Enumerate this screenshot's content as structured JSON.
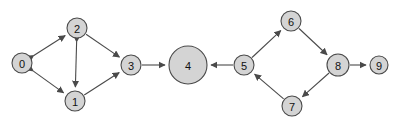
{
  "figure": {
    "title": "",
    "background_color": "#ffffff",
    "width": 399,
    "height": 121
  },
  "chart_data": {
    "type": "diagram",
    "diagram_kind": "directed-graph",
    "title": "",
    "node_fill_color": "#d4d4d4",
    "node_stroke_color": "#4a4a4a",
    "edge_color": "#4a4a4a",
    "label_color": "#111111",
    "nodes": [
      {
        "id": "0",
        "label": "0",
        "x": 22,
        "y": 63,
        "r": 10
      },
      {
        "id": "1",
        "label": "1",
        "x": 75,
        "y": 101,
        "r": 10
      },
      {
        "id": "2",
        "label": "2",
        "x": 77,
        "y": 28,
        "r": 10
      },
      {
        "id": "3",
        "label": "3",
        "x": 131,
        "y": 65,
        "r": 10
      },
      {
        "id": "4",
        "label": "4",
        "x": 188,
        "y": 65,
        "r": 19
      },
      {
        "id": "5",
        "label": "5",
        "x": 244,
        "y": 65,
        "r": 10
      },
      {
        "id": "6",
        "label": "6",
        "x": 291,
        "y": 21,
        "r": 10
      },
      {
        "id": "7",
        "label": "7",
        "x": 292,
        "y": 106,
        "r": 10
      },
      {
        "id": "8",
        "label": "8",
        "x": 338,
        "y": 65,
        "r": 11
      },
      {
        "id": "9",
        "label": "9",
        "x": 379,
        "y": 65,
        "r": 9
      }
    ],
    "edges": [
      {
        "from": "0",
        "to": "2",
        "directed": "both"
      },
      {
        "from": "0",
        "to": "1",
        "directed": "both"
      },
      {
        "from": "2",
        "to": "1",
        "directed": "both"
      },
      {
        "from": "2",
        "to": "3",
        "directed": "forward"
      },
      {
        "from": "1",
        "to": "3",
        "directed": "forward"
      },
      {
        "from": "3",
        "to": "4",
        "directed": "forward"
      },
      {
        "from": "5",
        "to": "4",
        "directed": "forward"
      },
      {
        "from": "5",
        "to": "6",
        "directed": "forward"
      },
      {
        "from": "6",
        "to": "8",
        "directed": "forward"
      },
      {
        "from": "8",
        "to": "7",
        "directed": "forward"
      },
      {
        "from": "7",
        "to": "5",
        "directed": "forward"
      },
      {
        "from": "8",
        "to": "9",
        "directed": "forward"
      }
    ]
  }
}
